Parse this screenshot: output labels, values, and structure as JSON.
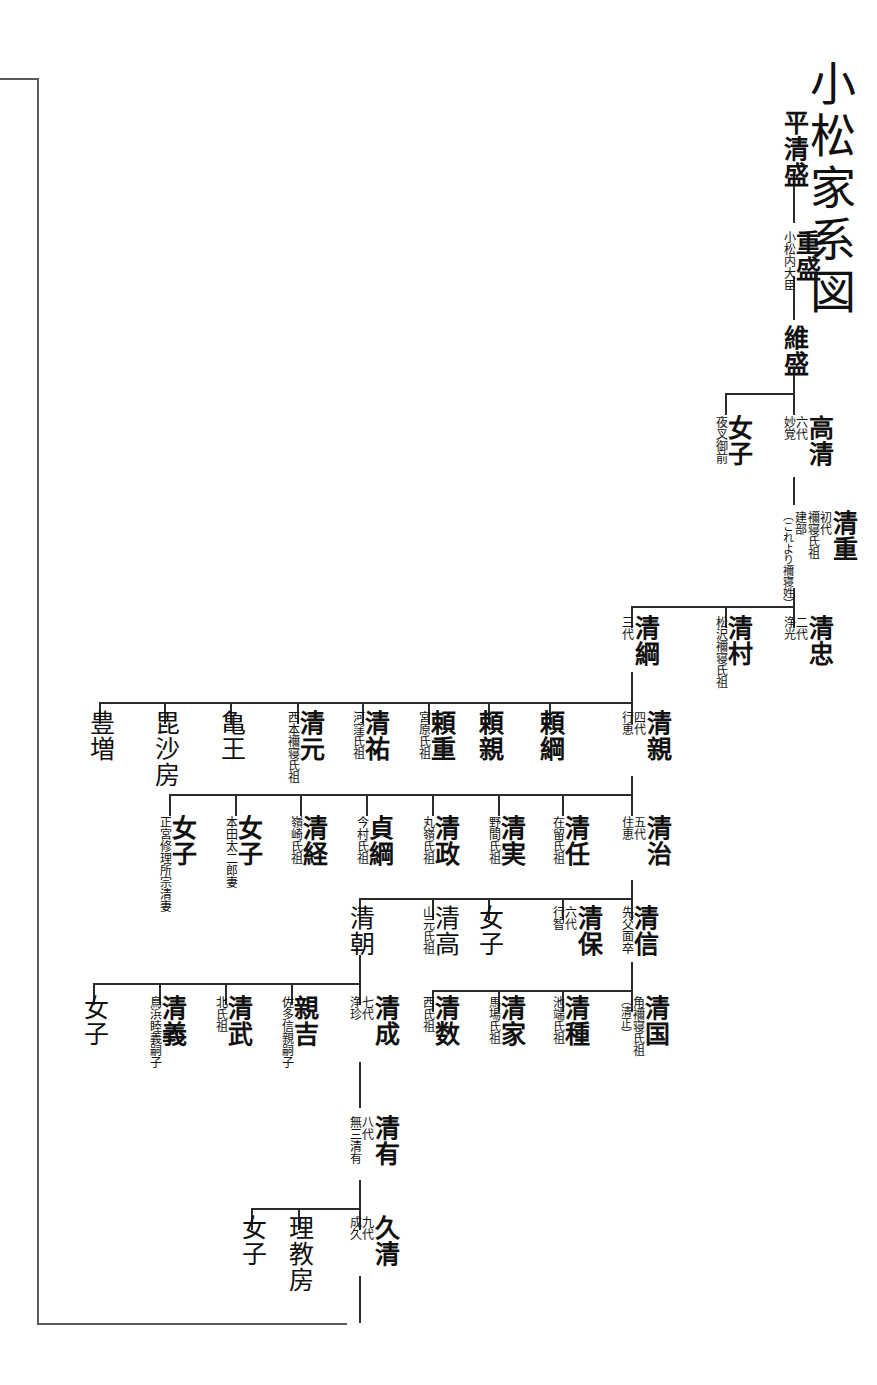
{
  "document": {
    "title": "小松家系図",
    "title_pos": {
      "x": 806,
      "y": 78
    }
  },
  "continuation_bracket": {
    "label": "lineage-continuation-bracket",
    "left_x": 37,
    "top_y": 78,
    "bottom_y": 1323,
    "right_x": 347
  },
  "nodes": [
    {
      "id": "taira-kiyomori",
      "name": "平清盛",
      "gen": "",
      "notes": [],
      "x": 782,
      "y": 110,
      "bold": true
    },
    {
      "id": "shigemori",
      "name": "重盛",
      "gen": "",
      "notes": [
        "小松内大臣"
      ],
      "x": 782,
      "y": 230,
      "bold": true
    },
    {
      "id": "koremori",
      "name": "維盛",
      "gen": "",
      "notes": [],
      "x": 782,
      "y": 325,
      "bold": true
    },
    {
      "id": "takakiyo",
      "name": "高清",
      "gen": "六代",
      "notes": [
        "妙覚"
      ],
      "x": 782,
      "y": 415,
      "bold": true
    },
    {
      "id": "joshi-yasha",
      "name": "女子",
      "gen": "",
      "notes": [
        "夜叉御前"
      ],
      "x": 714,
      "y": 415,
      "bold": true
    },
    {
      "id": "kiyoshige",
      "name": "清重",
      "gen": "初代",
      "notes": [
        "襧寝氏祖",
        "建部"
      ],
      "x": 782,
      "y": 510,
      "bold": true,
      "paren": "（これより襧寝姓）"
    },
    {
      "id": "kiyotada",
      "name": "清忠",
      "gen": "二代",
      "notes": [
        "浄光"
      ],
      "x": 782,
      "y": 615,
      "bold": true
    },
    {
      "id": "kiyomura",
      "name": "清村",
      "gen": "",
      "notes": [
        "松沢襧寝氏祖"
      ],
      "x": 714,
      "y": 615,
      "bold": true
    },
    {
      "id": "kiyotsuna",
      "name": "清綱",
      "gen": "三代",
      "notes": [],
      "x": 620,
      "y": 615,
      "bold": true
    },
    {
      "id": "kiyochika",
      "name": "清親",
      "gen": "四代",
      "notes": [
        "行恵"
      ],
      "x": 620,
      "y": 710,
      "bold": true
    },
    {
      "id": "yoritsuna",
      "name": "頼綱",
      "gen": "",
      "notes": [],
      "x": 538,
      "y": 710,
      "bold": true
    },
    {
      "id": "yorichika",
      "name": "頼親",
      "gen": "",
      "notes": [],
      "x": 477,
      "y": 710,
      "bold": true
    },
    {
      "id": "yorishige",
      "name": "頼重",
      "gen": "",
      "notes": [
        "宮原氏祖"
      ],
      "x": 417,
      "y": 710,
      "bold": true
    },
    {
      "id": "kiyosuke",
      "name": "清祐",
      "gen": "",
      "notes": [
        "河窪氏祖"
      ],
      "x": 351,
      "y": 710,
      "bold": true
    },
    {
      "id": "kiyomoto",
      "name": "清元",
      "gen": "",
      "notes": [
        "西本襧寝氏祖"
      ],
      "x": 286,
      "y": 710,
      "bold": true
    },
    {
      "id": "kameo",
      "name": "亀王",
      "gen": "",
      "notes": [],
      "x": 219,
      "y": 710,
      "bold": false
    },
    {
      "id": "bishabo",
      "name": "毘沙房",
      "gen": "",
      "notes": [],
      "x": 153,
      "y": 710,
      "bold": false
    },
    {
      "id": "toyomasu",
      "name": "豊増",
      "gen": "",
      "notes": [],
      "x": 88,
      "y": 710,
      "bold": false
    },
    {
      "id": "kiyoharu",
      "name": "清治",
      "gen": "五代",
      "notes": [
        "住恵"
      ],
      "x": 620,
      "y": 815,
      "bold": true
    },
    {
      "id": "kiyoto",
      "name": "清任",
      "gen": "",
      "notes": [
        "在留氏祖"
      ],
      "x": 551,
      "y": 815,
      "bold": true
    },
    {
      "id": "kiyomi",
      "name": "清実",
      "gen": "",
      "notes": [
        "野間氏祖"
      ],
      "x": 487,
      "y": 815,
      "bold": true
    },
    {
      "id": "kiyomasa",
      "name": "清政",
      "gen": "",
      "notes": [
        "丸嶺氏祖"
      ],
      "x": 421,
      "y": 815,
      "bold": true
    },
    {
      "id": "sadatsuna",
      "name": "貞綱",
      "gen": "",
      "notes": [
        "今村氏祖"
      ],
      "x": 355,
      "y": 815,
      "bold": true
    },
    {
      "id": "kiyotsune",
      "name": "清経",
      "gen": "",
      "notes": [
        "嶺崎氏祖"
      ],
      "x": 289,
      "y": 815,
      "bold": true
    },
    {
      "id": "joshi-honda",
      "name": "女子",
      "gen": "",
      "notes": [
        "本田太二郎妻"
      ],
      "x": 224,
      "y": 815,
      "bold": true
    },
    {
      "id": "joshi-shokyu",
      "name": "女子",
      "gen": "",
      "notes": [
        "正宮修理所宗清妻"
      ],
      "x": 158,
      "y": 815,
      "bold": true
    },
    {
      "id": "kiyonobu",
      "name": "清信",
      "gen": "",
      "notes": [
        "先父面卒"
      ],
      "x": 620,
      "y": 905,
      "bold": true
    },
    {
      "id": "kiyoyasu",
      "name": "清保",
      "gen": "六代",
      "notes": [
        "行智"
      ],
      "x": 551,
      "y": 905,
      "bold": true
    },
    {
      "id": "joshi-kiyoharu",
      "name": "女子",
      "gen": "",
      "notes": [],
      "x": 477,
      "y": 905,
      "bold": false
    },
    {
      "id": "kiyotaka",
      "name": "清高",
      "gen": "",
      "notes": [
        "山元氏祖"
      ],
      "x": 421,
      "y": 905,
      "bold": false
    },
    {
      "id": "kiyotomo",
      "name": "清朝",
      "gen": "",
      "notes": [],
      "x": 348,
      "y": 905,
      "bold": false
    },
    {
      "id": "kiyokuni",
      "name": "清国",
      "gen": "",
      "notes": [
        "角襧寝氏祖"
      ],
      "x": 620,
      "y": 995,
      "bold": true,
      "paren": "（清正）"
    },
    {
      "id": "kiyotane",
      "name": "清種",
      "gen": "",
      "notes": [
        "池端氏祖"
      ],
      "x": 551,
      "y": 995,
      "bold": true
    },
    {
      "id": "kiyoie",
      "name": "清家",
      "gen": "",
      "notes": [
        "馬場氏祖"
      ],
      "x": 487,
      "y": 995,
      "bold": true
    },
    {
      "id": "kiyokazu",
      "name": "清数",
      "gen": "",
      "notes": [
        "西氏祖"
      ],
      "x": 421,
      "y": 995,
      "bold": true
    },
    {
      "id": "kiyonari",
      "name": "清成",
      "gen": "七代",
      "notes": [
        "浄珍"
      ],
      "x": 348,
      "y": 995,
      "bold": true
    },
    {
      "id": "chikayoshi",
      "name": "親吉",
      "gen": "",
      "notes": [
        "佐多信親嗣子"
      ],
      "x": 280,
      "y": 995,
      "bold": true
    },
    {
      "id": "kiyotake",
      "name": "清武",
      "gen": "",
      "notes": [
        "北氏祖"
      ],
      "x": 214,
      "y": 995,
      "bold": true
    },
    {
      "id": "kiyoyoshi",
      "name": "清義",
      "gen": "",
      "notes": [
        "鳥浜睦義嗣子"
      ],
      "x": 148,
      "y": 995,
      "bold": true
    },
    {
      "id": "joshi-kiyonari",
      "name": "女子",
      "gen": "",
      "notes": [],
      "x": 82,
      "y": 995,
      "bold": false
    },
    {
      "id": "kiyoari",
      "name": "清有",
      "gen": "八代",
      "notes": [
        "無三清有"
      ],
      "x": 348,
      "y": 1115,
      "bold": true
    },
    {
      "id": "hisakiyo",
      "name": "久清",
      "gen": "九代",
      "notes": [
        "成久"
      ],
      "x": 348,
      "y": 1215,
      "bold": true
    },
    {
      "id": "rikyobo",
      "name": "理教房",
      "gen": "",
      "notes": [],
      "x": 287,
      "y": 1215,
      "bold": false
    },
    {
      "id": "joshi-hisakiyo",
      "name": "女子",
      "gen": "",
      "notes": [],
      "x": 240,
      "y": 1215,
      "bold": false
    }
  ],
  "connectors": {
    "vertical_stems": [
      {
        "name": "stem-kiyomori-shigemori",
        "x": 793,
        "y": 175,
        "h": 48
      },
      {
        "name": "stem-shigemori-koremori",
        "x": 793,
        "y": 276,
        "h": 44
      },
      {
        "name": "stem-koremori-down",
        "x": 793,
        "y": 371,
        "h": 22
      },
      {
        "name": "stem-takakiyo-kiyoshige",
        "x": 793,
        "y": 477,
        "h": 28
      },
      {
        "name": "stem-kiyoshige-down",
        "x": 793,
        "y": 588,
        "h": 18
      },
      {
        "name": "stem-kiyotsuna-kiyochika",
        "x": 631,
        "y": 672,
        "h": 30
      },
      {
        "name": "stem-kiyochika-down",
        "x": 631,
        "y": 776,
        "h": 18
      },
      {
        "name": "stem-kiyoharu-down",
        "x": 631,
        "y": 880,
        "h": 18
      },
      {
        "name": "stem-kiyonobu-down",
        "x": 631,
        "y": 962,
        "h": 28
      },
      {
        "name": "stem-kiyotomo-down",
        "x": 359,
        "y": 955,
        "h": 28
      },
      {
        "name": "stem-kiyonari-kiyoari",
        "x": 359,
        "y": 1062,
        "h": 46
      },
      {
        "name": "stem-kiyoari-hisakiyo",
        "x": 359,
        "y": 1180,
        "h": 28
      },
      {
        "name": "stem-hisakiyo-down",
        "x": 359,
        "y": 1276,
        "h": 47
      }
    ],
    "sibling_groups": [
      {
        "name": "group-koremori-children",
        "y": 393,
        "x_from": 725,
        "x_to": 793,
        "drops": [
          725,
          793
        ]
      },
      {
        "name": "group-kiyoshige-children",
        "y": 606,
        "x_from": 631,
        "x_to": 793,
        "drops": [
          631,
          725,
          793
        ]
      },
      {
        "name": "group-kiyotsuna-children",
        "y": 702,
        "x_from": 99,
        "x_to": 631,
        "drops": [
          99,
          164,
          230,
          297,
          362,
          428,
          488,
          549,
          631
        ]
      },
      {
        "name": "group-kiyochika-children",
        "y": 794,
        "x_from": 169,
        "x_to": 631,
        "drops": [
          169,
          235,
          300,
          366,
          432,
          498,
          562,
          631
        ]
      },
      {
        "name": "group-kiyoharu-children",
        "y": 898,
        "x_from": 359,
        "x_to": 631,
        "drops": [
          359,
          432,
          488,
          562,
          631
        ]
      },
      {
        "name": "group-kiyonobu-children",
        "y": 990,
        "x_from": 432,
        "x_to": 631,
        "drops": [
          432,
          498,
          562,
          631
        ]
      },
      {
        "name": "group-kiyotomo-children",
        "y": 983,
        "x_from": 93,
        "x_to": 359,
        "drops": [
          93,
          159,
          225,
          291,
          359
        ]
      },
      {
        "name": "group-hisakiyo-siblings",
        "y": 1208,
        "x_from": 251,
        "x_to": 359,
        "drops": [
          251,
          298,
          359
        ]
      }
    ]
  }
}
